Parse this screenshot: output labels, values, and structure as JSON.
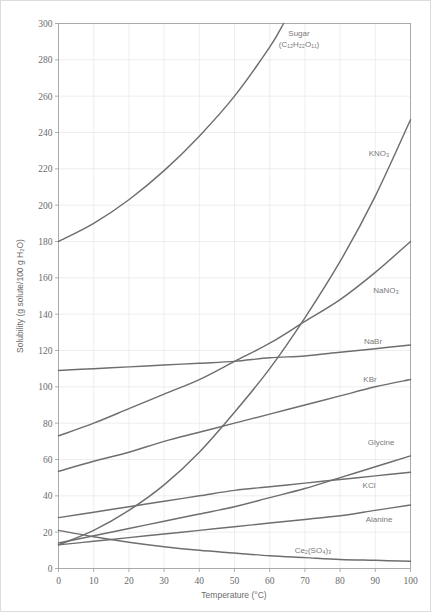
{
  "chart_data": {
    "type": "line",
    "title": "",
    "xlabel": "Temperature (°C)",
    "ylabel": "Solubility (g solute/100 g H₂O)",
    "xlim": [
      0,
      100
    ],
    "ylim": [
      0,
      300
    ],
    "xticks": [
      0,
      10,
      20,
      30,
      40,
      50,
      60,
      70,
      80,
      90,
      100
    ],
    "yticks": [
      0,
      20,
      40,
      60,
      80,
      100,
      120,
      140,
      160,
      180,
      200,
      220,
      240,
      260,
      280,
      300
    ],
    "grid": true,
    "legend_position": "inline-labels",
    "line_color": "#6e6e6e",
    "grid_color": "#e2e2e2",
    "frame_color": "#9a9a9a",
    "x": [
      0,
      10,
      20,
      30,
      40,
      50,
      60,
      70,
      80,
      90,
      100
    ],
    "series": [
      {
        "name": "Sugar",
        "label": "Sugar",
        "formula_pre": "(C",
        "formula": "(C12H22O11)",
        "values": [
          180,
          190,
          203,
          219,
          238,
          260,
          287,
          320,
          362,
          415,
          487
        ],
        "label_x": 70,
        "label_y": 292
      },
      {
        "name": "KNO3",
        "label": "KNO₃",
        "values": [
          13,
          21,
          32,
          46,
          64,
          86,
          110,
          138,
          169,
          205,
          247
        ],
        "label_x": 82,
        "label_y": 215
      },
      {
        "name": "NaNO3",
        "label": "NaNO₃",
        "values": [
          73,
          80,
          88,
          96,
          104,
          114,
          124,
          136,
          148,
          163,
          180
        ],
        "label_x": 84,
        "label_y": 155
      },
      {
        "name": "NaBr",
        "label": "NaBr",
        "values": [
          109,
          110,
          111,
          112,
          113,
          114,
          116,
          117,
          119,
          121,
          123
        ],
        "label_x": 79,
        "label_y": 127
      },
      {
        "name": "KBr",
        "label": "KBr",
        "values": [
          53.5,
          59,
          64,
          70,
          75,
          80,
          85,
          90,
          95,
          100,
          104
        ],
        "label_x": 80,
        "label_y": 112
      },
      {
        "name": "Glycine",
        "label": "Glycine",
        "values": [
          14,
          18,
          22,
          26,
          30,
          34,
          39,
          44,
          50,
          56,
          62
        ],
        "label_x": 81,
        "label_y": 69
      },
      {
        "name": "KCl",
        "label": "KCl",
        "values": [
          28,
          31,
          34,
          37,
          40,
          43,
          45,
          47,
          49,
          51,
          53
        ],
        "label_x": 81,
        "label_y": 48
      },
      {
        "name": "Alanine",
        "label": "Alanine",
        "values": [
          13,
          15,
          17,
          19,
          21,
          23,
          25,
          27,
          29,
          32,
          35
        ],
        "label_x": 81,
        "label_y": 25
      },
      {
        "name": "Ce2(SO4)3",
        "label": "Ce₂(SO₄)₃",
        "values": [
          21,
          17.5,
          14.5,
          12,
          10,
          8.5,
          7,
          6,
          5,
          4.5,
          4
        ],
        "label_x": 65,
        "label_y": 15
      }
    ],
    "curve_labels": [
      {
        "text": "Sugar",
        "sub_line": "(C₁₂H₂₂O₁₁)",
        "px": 298,
        "py": 35
      },
      {
        "text": "KNO₃",
        "sub_line": "",
        "px": 378,
        "py": 155
      },
      {
        "text": "NaNO₃",
        "sub_line": "",
        "px": 385,
        "py": 292
      },
      {
        "text": "NaBr",
        "sub_line": "",
        "px": 372,
        "py": 343
      },
      {
        "text": "KBr",
        "sub_line": "",
        "px": 369,
        "py": 381
      },
      {
        "text": "Glycine",
        "sub_line": "",
        "px": 380,
        "py": 444
      },
      {
        "text": "KCl",
        "sub_line": "",
        "px": 368,
        "py": 487
      },
      {
        "text": "Alanine",
        "sub_line": "",
        "px": 378,
        "py": 521
      },
      {
        "text": "Ce₂(SO₄)₃",
        "sub_line": "",
        "px": 312,
        "py": 552
      }
    ]
  },
  "axes": {
    "x_title": "Temperature (°C)",
    "y_title": "Solubility (g solute/100 g H₂O)",
    "x_tick_labels": [
      "0",
      "10",
      "20",
      "30",
      "40",
      "50",
      "60",
      "70",
      "80",
      "90",
      "100"
    ],
    "y_tick_labels": [
      "0",
      "20",
      "40",
      "60",
      "80",
      "100",
      "120",
      "140",
      "160",
      "180",
      "200",
      "220",
      "240",
      "260",
      "280",
      "300"
    ]
  }
}
